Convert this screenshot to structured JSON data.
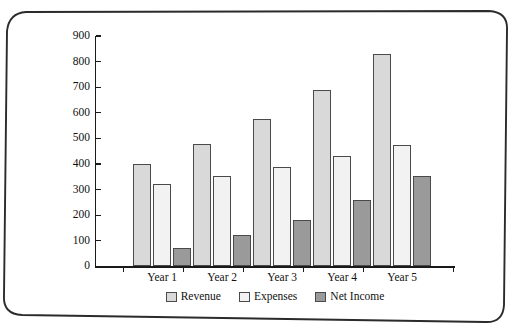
{
  "chart_data": {
    "type": "bar",
    "title": "",
    "subtitle": "",
    "xlabel": "",
    "ylabel": "",
    "categories": [
      "Year 1",
      "Year 2",
      "Year 3",
      "Year 4",
      "Year 5"
    ],
    "series": [
      {
        "name": "Revenue",
        "color": "#d9d9d9",
        "values": [
          400,
          480,
          575,
          690,
          828
        ]
      },
      {
        "name": "Expenses",
        "color": "#f2f2f2",
        "values": [
          322,
          355,
          390,
          430,
          475
        ]
      },
      {
        "name": "Net Income",
        "color": "#9a9a9a",
        "values": [
          73,
          122,
          183,
          258,
          352
        ]
      }
    ],
    "ylim": [
      0,
      900
    ],
    "ytick_step": 100,
    "yticks": [
      0,
      100,
      200,
      300,
      400,
      500,
      600,
      700,
      800,
      900
    ],
    "ytick_labels": [
      "0",
      "100",
      "200",
      "300",
      "400",
      "500",
      "600",
      "700",
      "800",
      "900"
    ],
    "grid": false,
    "legend_position": "bottom",
    "legend_entries": [
      "Revenue",
      "Expenses",
      "Net Income"
    ]
  },
  "frame": {
    "style": "rounded-scan-border",
    "color": "#2b2b2b"
  }
}
